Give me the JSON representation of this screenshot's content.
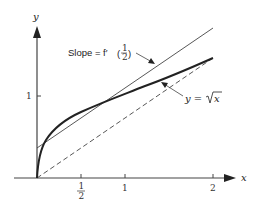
{
  "figure": {
    "axes": {
      "x_label": "x",
      "y_label": "y",
      "x_ticks": [
        {
          "value": 0.5,
          "label_num": "1",
          "label_den": "2"
        },
        {
          "value": 1,
          "label": "1"
        },
        {
          "value": 2,
          "label": "2"
        }
      ],
      "y_ticks": [
        {
          "value": 1,
          "label": "1"
        }
      ]
    },
    "annotations": {
      "slope_label": "Slope = f′",
      "slope_frac_num": "1",
      "slope_frac_den": "2",
      "curve_label_prefix": "y = ",
      "curve_label_radicand": "x"
    },
    "curves": [
      {
        "name": "sqrt-curve",
        "equation": "y = sqrt(x)",
        "style": "thick solid"
      },
      {
        "name": "tangent-line",
        "equation": "tangent at x = 1/2, slope f'(1/2)",
        "style": "thin solid"
      },
      {
        "name": "secant-line",
        "equation": "line through (0,0) and (2, sqrt 2)",
        "style": "dashed"
      }
    ],
    "colors": {
      "stroke": "#333333",
      "background": "#ffffff"
    }
  }
}
